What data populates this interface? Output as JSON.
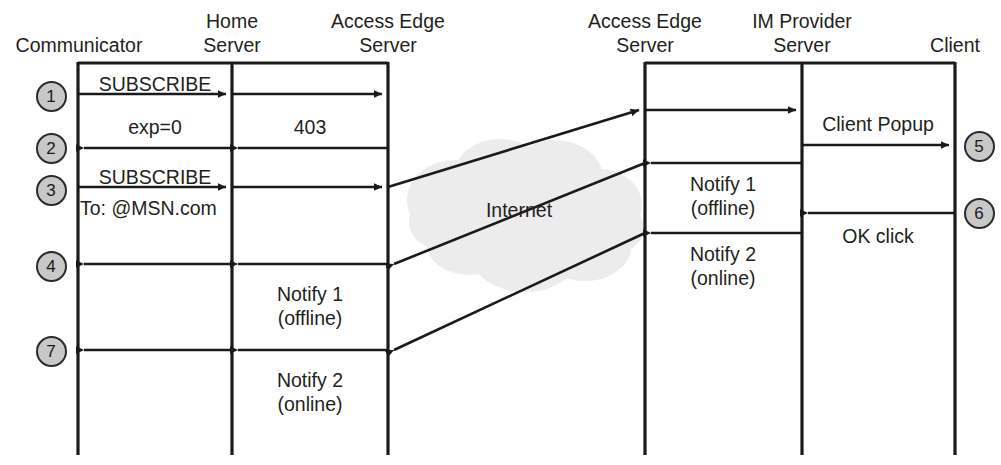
{
  "diagram": {
    "type": "sequence-diagram",
    "background_color": "#ffffff",
    "line_color": "#1a1a1a",
    "text_color": "#231f20",
    "step_badge_fill": "#c8c8c8",
    "cloud_color": "#ebebeb"
  },
  "lifelines": [
    {
      "id": "communicator",
      "label_lines": [
        "Communicator"
      ],
      "x": 78
    },
    {
      "id": "home-server",
      "label_lines": [
        "Home",
        "Server"
      ],
      "x": 232
    },
    {
      "id": "access-edge-server-left",
      "label_lines": [
        "Access Edge",
        "Server"
      ],
      "x": 388
    },
    {
      "id": "access-edge-server-right",
      "label_lines": [
        "Access Edge",
        "Server"
      ],
      "x": 645
    },
    {
      "id": "im-provider-server",
      "label_lines": [
        "IM Provider",
        "Server"
      ],
      "x": 802
    },
    {
      "id": "client",
      "label_lines": [
        "Client"
      ],
      "x": 955
    }
  ],
  "cloud": {
    "label": "Internet",
    "center_x": 519,
    "center_y": 210
  },
  "messages": [
    {
      "id": "m1",
      "label_lines": [
        "SUBSCRIBE"
      ],
      "from": "communicator",
      "to": "home-server",
      "y": 94,
      "direction": "right"
    },
    {
      "id": "m1b",
      "label_lines": [],
      "from": "home-server",
      "to": "access-edge-server-left",
      "y": 94,
      "direction": "right"
    },
    {
      "id": "m2a",
      "label_lines": [
        "exp=0"
      ],
      "from": "home-server",
      "to": "communicator",
      "y": 148,
      "direction": "left"
    },
    {
      "id": "m2b",
      "label_lines": [
        "403"
      ],
      "from": "access-edge-server-left",
      "to": "home-server",
      "y": 148,
      "direction": "left"
    },
    {
      "id": "m3",
      "label_lines": [
        "SUBSCRIBE",
        "To: @MSN.com"
      ],
      "from": "communicator",
      "to": "home-server",
      "y": 187,
      "direction": "right"
    },
    {
      "id": "m3b",
      "label_lines": [],
      "from": "home-server",
      "to": "access-edge-server-left",
      "y": 187,
      "direction": "right"
    },
    {
      "id": "m3c",
      "label_lines": [],
      "from": "access-edge-server-left",
      "to": "access-edge-server-right",
      "y": 187,
      "direction": "right-diagonal"
    },
    {
      "id": "m3d",
      "label_lines": [],
      "from": "access-edge-server-right",
      "to": "im-provider-server",
      "y": 110,
      "direction": "right"
    },
    {
      "id": "m5",
      "label_lines": [
        "Client Popup"
      ],
      "from": "im-provider-server",
      "to": "client",
      "y": 145,
      "direction": "right"
    },
    {
      "id": "m4a",
      "label_lines": [
        "Notify 1",
        "(offline)"
      ],
      "from": "im-provider-server",
      "to": "access-edge-server-right",
      "y": 163,
      "direction": "left"
    },
    {
      "id": "m4b",
      "label_lines": [],
      "from": "access-edge-server-right",
      "to": "access-edge-server-left",
      "y": 264,
      "direction": "left-diagonal"
    },
    {
      "id": "m4c",
      "label_lines": [
        "Notify 1",
        "(offline)"
      ],
      "from": "access-edge-server-left",
      "to": "home-server",
      "y": 264,
      "direction": "left"
    },
    {
      "id": "m4d",
      "label_lines": [],
      "from": "home-server",
      "to": "communicator",
      "y": 264,
      "direction": "left"
    },
    {
      "id": "m6",
      "label_lines": [
        "OK click"
      ],
      "from": "client",
      "to": "im-provider-server",
      "y": 213,
      "direction": "left"
    },
    {
      "id": "m7a",
      "label_lines": [
        "Notify 2",
        "(online)"
      ],
      "from": "im-provider-server",
      "to": "access-edge-server-right",
      "y": 233,
      "direction": "left"
    },
    {
      "id": "m7b",
      "label_lines": [],
      "from": "access-edge-server-right",
      "to": "access-edge-server-left",
      "y": 350,
      "direction": "left-diagonal"
    },
    {
      "id": "m7c",
      "label_lines": [
        "Notify 2",
        "(online)"
      ],
      "from": "access-edge-server-left",
      "to": "home-server",
      "y": 350,
      "direction": "left"
    },
    {
      "id": "m7d",
      "label_lines": [],
      "from": "home-server",
      "to": "communicator",
      "y": 350,
      "direction": "left"
    }
  ],
  "step_badges": [
    {
      "id": "step-1",
      "number": "1",
      "cx": 51,
      "cy": 96
    },
    {
      "id": "step-2",
      "number": "2",
      "cx": 51,
      "cy": 148
    },
    {
      "id": "step-3",
      "number": "3",
      "cx": 51,
      "cy": 190
    },
    {
      "id": "step-4",
      "number": "4",
      "cx": 51,
      "cy": 266
    },
    {
      "id": "step-7",
      "number": "7",
      "cx": 51,
      "cy": 351
    },
    {
      "id": "step-5",
      "number": "5",
      "cx": 979,
      "cy": 146
    },
    {
      "id": "step-6",
      "number": "6",
      "cx": 979,
      "cy": 213
    }
  ],
  "headers": [
    {
      "id": "header-communicator",
      "lines": [
        "Communicator"
      ],
      "x": 79,
      "align": "center",
      "top": 33
    },
    {
      "id": "header-home-server",
      "lines": [
        "Home",
        "Server"
      ],
      "x": 232,
      "align": "center",
      "top": 9
    },
    {
      "id": "header-access-edge-left",
      "lines": [
        "Access Edge",
        "Server"
      ],
      "x": 388,
      "align": "center",
      "top": 9
    },
    {
      "id": "header-access-edge-right",
      "lines": [
        "Access Edge",
        "Server"
      ],
      "x": 645,
      "align": "center",
      "top": 9
    },
    {
      "id": "header-im-provider",
      "lines": [
        "IM Provider",
        "Server"
      ],
      "x": 802,
      "align": "center",
      "top": 9
    },
    {
      "id": "header-client",
      "lines": [
        "Client"
      ],
      "x": 955,
      "align": "center",
      "top": 33
    }
  ],
  "annotations": [
    {
      "id": "ann-subscribe-1",
      "text": "SUBSCRIBE",
      "x": 155,
      "y": 72,
      "align": "center"
    },
    {
      "id": "ann-exp0",
      "text": "exp=0",
      "x": 155,
      "y": 115,
      "align": "center"
    },
    {
      "id": "ann-403",
      "text": "403",
      "x": 310,
      "y": 115,
      "align": "center"
    },
    {
      "id": "ann-subscribe-2",
      "text": "SUBSCRIBE",
      "x": 155,
      "y": 165,
      "align": "center"
    },
    {
      "id": "ann-to-msn",
      "text": "To: @MSN.com",
      "x": 80,
      "y": 196,
      "align": "left"
    },
    {
      "id": "ann-internet",
      "text": "Internet",
      "x": 519,
      "y": 198,
      "align": "center"
    },
    {
      "id": "ann-client-popup",
      "text": "Client Popup",
      "x": 878,
      "y": 112,
      "align": "center"
    },
    {
      "id": "ann-notify1-right-a",
      "text": "Notify 1",
      "x": 723,
      "y": 172,
      "align": "center"
    },
    {
      "id": "ann-notify1-right-b",
      "text": "(offline)",
      "x": 723,
      "y": 196,
      "align": "center"
    },
    {
      "id": "ann-ok-click",
      "text": "OK click",
      "x": 878,
      "y": 224,
      "align": "center"
    },
    {
      "id": "ann-notify2-right-a",
      "text": "Notify 2",
      "x": 723,
      "y": 242,
      "align": "center"
    },
    {
      "id": "ann-notify2-right-b",
      "text": "(online)",
      "x": 723,
      "y": 266,
      "align": "center"
    },
    {
      "id": "ann-notify1-left-a",
      "text": "Notify 1",
      "x": 310,
      "y": 282,
      "align": "center"
    },
    {
      "id": "ann-notify1-left-b",
      "text": "(offline)",
      "x": 310,
      "y": 306,
      "align": "center"
    },
    {
      "id": "ann-notify2-left-a",
      "text": "Notify 2",
      "x": 310,
      "y": 368,
      "align": "center"
    },
    {
      "id": "ann-notify2-left-b",
      "text": "(online)",
      "x": 310,
      "y": 392,
      "align": "center"
    }
  ]
}
